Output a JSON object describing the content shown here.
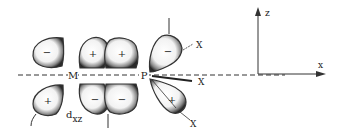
{
  "diagram": {
    "title": "",
    "metal_label": "M",
    "ligand_atom_label": "P",
    "metal_orbital_label": "d",
    "metal_orbital_subscript": "xz",
    "substituent_labels": [
      "X",
      "X",
      "X"
    ],
    "lobe_signs": {
      "metal_upper_left": "−",
      "metal_lower_left": "+",
      "metal_upper_middle_left": "+",
      "metal_upper_middle_right": "+",
      "metal_lower_middle_left": "−",
      "metal_lower_middle_right": "−",
      "p_upper": "−",
      "p_lower": "+"
    },
    "axes": {
      "vertical_label": "z",
      "horizontal_label": "x"
    }
  }
}
